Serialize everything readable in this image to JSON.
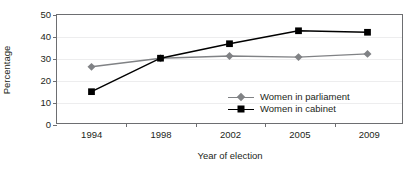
{
  "chart_data": {
    "type": "line",
    "title": "",
    "xlabel": "Year of election",
    "ylabel": "Percentage",
    "categories": [
      "1994",
      "1998",
      "2002",
      "2005",
      "2009"
    ],
    "ylim": [
      0,
      50
    ],
    "yticks": [
      "0",
      "10",
      "20",
      "30",
      "40",
      "50"
    ],
    "grid": "horizontal",
    "legend_position": "inside-lower-right",
    "series": [
      {
        "name": "Women in parliament",
        "values": [
          26,
          30,
          31,
          30.5,
          32
        ],
        "color": "#808285",
        "marker": "diamond"
      },
      {
        "name": "Women in cabinet",
        "values": [
          14.5,
          30,
          36.7,
          42.7,
          42
        ],
        "color": "#000000",
        "marker": "square"
      }
    ]
  },
  "axes": {
    "y_title": "Percentage",
    "x_title": "Year of election"
  },
  "legend": {
    "items": [
      {
        "label": "Women in parliament"
      },
      {
        "label": "Women in cabinet"
      }
    ]
  },
  "colors": {
    "frame": "#6d6e71",
    "grid": "#ededee",
    "parliament": "#808285",
    "cabinet": "#000000",
    "text": "#231f20"
  }
}
